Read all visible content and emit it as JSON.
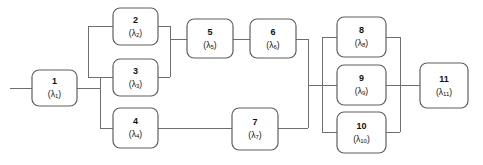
{
  "diagram": {
    "type": "reliability-block-diagram",
    "background_color": "#ffffff",
    "line_color": "#6f6f6f",
    "block_border_color": "#5f5f5f",
    "block_fill_color": "#ffffff",
    "text_color": "#111111"
  },
  "blocks": [
    {
      "key": "b1",
      "id": "1",
      "rate_prefix": "(λ",
      "rate_sub": "1",
      "rate_suffix": ")",
      "x": 32,
      "y": 70,
      "w": 45,
      "h": 36
    },
    {
      "key": "b2",
      "id": "2",
      "rate_prefix": "(λ",
      "rate_sub": "2",
      "rate_suffix": ")",
      "x": 113,
      "y": 8,
      "w": 45,
      "h": 37
    },
    {
      "key": "b3",
      "id": "3",
      "rate_prefix": "(λ",
      "rate_sub": "3",
      "rate_suffix": ")",
      "x": 113,
      "y": 59,
      "w": 45,
      "h": 37
    },
    {
      "key": "b4",
      "id": "4",
      "rate_prefix": "(λ",
      "rate_sub": "4",
      "rate_suffix": ")",
      "x": 113,
      "y": 108,
      "w": 45,
      "h": 40
    },
    {
      "key": "b5",
      "id": "5",
      "rate_prefix": "(λ",
      "rate_sub": "5",
      "rate_suffix": ")",
      "x": 187,
      "y": 19,
      "w": 46,
      "h": 39
    },
    {
      "key": "b6",
      "id": "6",
      "rate_prefix": "(λ",
      "rate_sub": "6",
      "rate_suffix": ")",
      "x": 250,
      "y": 19,
      "w": 46,
      "h": 39
    },
    {
      "key": "b7",
      "id": "7",
      "rate_prefix": "(λ",
      "rate_sub": "7",
      "rate_suffix": ")",
      "x": 232,
      "y": 108,
      "w": 46,
      "h": 42
    },
    {
      "key": "b8",
      "id": "8",
      "rate_prefix": "(λ",
      "rate_sub": "8",
      "rate_suffix": ")",
      "x": 337,
      "y": 17,
      "w": 49,
      "h": 40
    },
    {
      "key": "b9",
      "id": "9",
      "rate_prefix": "(λ",
      "rate_sub": "9",
      "rate_suffix": ")",
      "x": 337,
      "y": 65,
      "w": 49,
      "h": 40
    },
    {
      "key": "b10",
      "id": "10",
      "rate_prefix": "(λ",
      "rate_sub": "10",
      "rate_suffix": ")",
      "x": 337,
      "y": 112,
      "w": 49,
      "h": 41
    },
    {
      "key": "b11",
      "id": "11",
      "rate_prefix": "(λ",
      "rate_sub": "11",
      "rate_suffix": ")",
      "x": 420,
      "y": 63,
      "w": 48,
      "h": 45
    }
  ],
  "wires": [
    {
      "key": "w-input-stub",
      "d": "M 10 88 L 32 88"
    },
    {
      "key": "w-b1-out",
      "d": "M 77 88 L 100 88"
    },
    {
      "key": "w-left-bus",
      "d": "M 100 77 L 100 128"
    },
    {
      "key": "w-bus-to-b4",
      "d": "M 100 128 L 113 128"
    },
    {
      "key": "w-bus-to-23-tap",
      "d": "M 100 77 L 88 77"
    },
    {
      "key": "w-23-fan-bus",
      "d": "M 88 26 L 88 77"
    },
    {
      "key": "w-fan-to-b2",
      "d": "M 88 26 L 113 26"
    },
    {
      "key": "w-b3-in",
      "d": "M 100 77 L 113 77"
    },
    {
      "key": "w-b2-out",
      "d": "M 158 26 L 170 26"
    },
    {
      "key": "w-b3-out",
      "d": "M 158 77 L 170 77"
    },
    {
      "key": "w-23-merge-bus",
      "d": "M 170 26 L 170 77"
    },
    {
      "key": "w-23-merge-to-b5",
      "d": "M 170 39 L 187 39"
    },
    {
      "key": "w-b5-to-b6",
      "d": "M 233 39 L 250 39"
    },
    {
      "key": "w-b6-out",
      "d": "M 296 39 L 308 39"
    },
    {
      "key": "w-b4-out",
      "d": "M 158 128 L 232 128"
    },
    {
      "key": "w-b7-out",
      "d": "M 278 128 L 308 128"
    },
    {
      "key": "w-67-merge-bus",
      "d": "M 308 39 L 308 128"
    },
    {
      "key": "w-67-merge-to-right",
      "d": "M 308 85 L 322 85"
    },
    {
      "key": "w-right-fan-bus",
      "d": "M 322 37 L 322 132"
    },
    {
      "key": "w-fan-to-b8",
      "d": "M 322 37 L 337 37"
    },
    {
      "key": "w-fan-to-b9",
      "d": "M 322 85 L 337 85"
    },
    {
      "key": "w-fan-to-b10",
      "d": "M 322 132 L 337 132"
    },
    {
      "key": "w-b8-out",
      "d": "M 386 37 L 400 37"
    },
    {
      "key": "w-b9-out",
      "d": "M 386 85 L 400 85"
    },
    {
      "key": "w-b10-out",
      "d": "M 386 132 L 400 132"
    },
    {
      "key": "w-89-10-merge-bus",
      "d": "M 400 37 L 400 132"
    },
    {
      "key": "w-merge-to-b11",
      "d": "M 400 85 L 420 85"
    }
  ]
}
